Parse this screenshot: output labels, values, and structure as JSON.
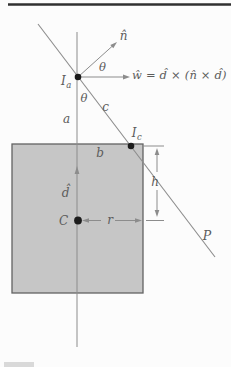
{
  "figure": {
    "labels": {
      "n_hat": "n̂",
      "theta_upper": "θ",
      "theta_lower": "θ",
      "w_equation": "ŵ = d̂ × (n̂ × d̂)",
      "point_Ia": {
        "main": "I",
        "sub": "a"
      },
      "point_Ic": {
        "main": "I",
        "sub": "c"
      },
      "seg_a": "a",
      "seg_b": "b",
      "seg_c": "c",
      "dim_h": "h",
      "dim_r": "r",
      "d_hat": "d̂",
      "center": "C",
      "plane": "P"
    },
    "colors": {
      "square_fill": "#c6c6c6",
      "square_border": "#636363",
      "line": "#8c8c8c",
      "text": "#5b5b5b",
      "dot": "#1c1c1c",
      "rule": "#303030",
      "strip": "#d9d9d9"
    }
  }
}
